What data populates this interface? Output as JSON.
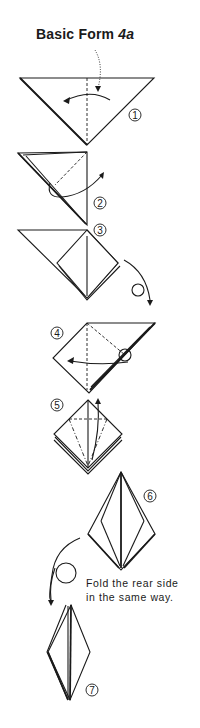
{
  "title": {
    "text": "Basic Form ",
    "number": "4a"
  },
  "steps": [
    {
      "label": "1",
      "symbol": "①"
    },
    {
      "label": "2",
      "symbol": "②"
    },
    {
      "label": "3",
      "symbol": "③"
    },
    {
      "label": "4",
      "symbol": "④"
    },
    {
      "label": "5",
      "symbol": "⑤"
    },
    {
      "label": "6",
      "symbol": "⑥"
    },
    {
      "label": "7",
      "symbol": "⑦"
    }
  ],
  "note": {
    "line1": "Fold the rear side",
    "line2": "in the same way."
  },
  "colors": {
    "ink": "#1a1a1a",
    "paper": "#ffffff"
  }
}
